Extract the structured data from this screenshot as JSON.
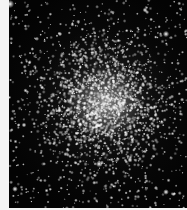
{
  "image": {
    "subject": "globular star cluster",
    "width": 187,
    "height": 210,
    "border_left_px": 9,
    "border_bottom_px": 2,
    "border_color": "#f4f4f4",
    "sky_color": "#030303",
    "cluster_center": [
      96,
      103
    ],
    "star_field": {
      "seed": 1337,
      "background_star_count": 700,
      "cluster_star_count": 1800,
      "cluster_sigma": 30
    },
    "bright_stars": [
      {
        "x": 10,
        "y": 4,
        "r": 2.6
      },
      {
        "x": 166,
        "y": 34,
        "r": 2.0
      },
      {
        "x": 114,
        "y": 107,
        "r": 1.8
      },
      {
        "x": 99,
        "y": 164,
        "r": 2.0
      },
      {
        "x": 15,
        "y": 189,
        "r": 1.8
      },
      {
        "x": 166,
        "y": 192,
        "r": 1.8
      },
      {
        "x": 130,
        "y": 160,
        "r": 1.6
      },
      {
        "x": 24,
        "y": 125,
        "r": 1.5
      },
      {
        "x": 60,
        "y": 34,
        "r": 1.4
      },
      {
        "x": 145,
        "y": 10,
        "r": 1.5
      }
    ]
  }
}
